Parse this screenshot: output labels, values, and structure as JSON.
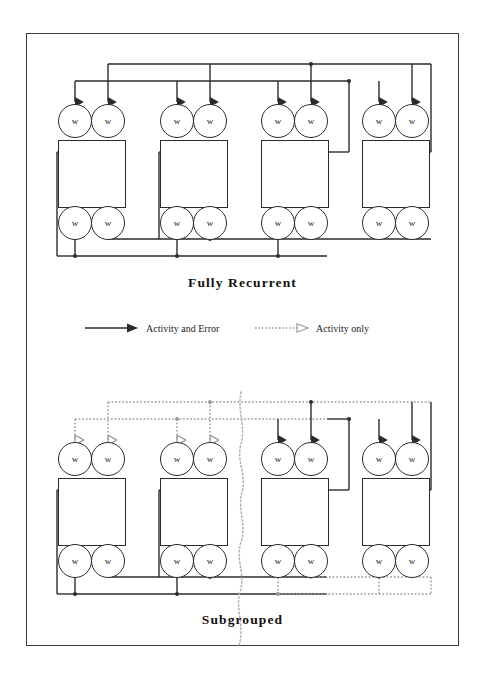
{
  "figure": {
    "panels": [
      {
        "id": "fully-recurrent",
        "title": "Fully Recurrent",
        "modules": [
          {
            "label_top_left": "w",
            "label_top_right": "w",
            "label_bottom_left": "w",
            "label_bottom_right": "w"
          },
          {
            "label_top_left": "w",
            "label_top_right": "w",
            "label_bottom_left": "w",
            "label_bottom_right": "w"
          },
          {
            "label_top_left": "w",
            "label_top_right": "w",
            "label_bottom_left": "w",
            "label_bottom_right": "w"
          },
          {
            "label_top_left": "w",
            "label_top_right": "w",
            "label_bottom_left": "w",
            "label_bottom_right": "w"
          }
        ]
      },
      {
        "id": "subgrouped",
        "title": "Subgrouped",
        "modules": [
          {
            "label_top_left": "w",
            "label_top_right": "w",
            "label_bottom_left": "w",
            "label_bottom_right": "w"
          },
          {
            "label_top_left": "w",
            "label_top_right": "w",
            "label_bottom_left": "w",
            "label_bottom_right": "w"
          },
          {
            "label_top_left": "w",
            "label_top_right": "w",
            "label_bottom_left": "w",
            "label_bottom_right": "w"
          },
          {
            "label_top_left": "w",
            "label_top_right": "w",
            "label_bottom_left": "w",
            "label_bottom_right": "w"
          }
        ]
      }
    ],
    "legend": {
      "items": [
        {
          "label": "Activity and Error",
          "style": "solid"
        },
        {
          "label": "Activity only",
          "style": "dotted"
        }
      ]
    },
    "colors": {
      "stroke_solid": "#2b2b2b",
      "stroke_dotted": "#9a9a9a",
      "frame": "#3a3a3a",
      "background": "#ffffff"
    }
  }
}
